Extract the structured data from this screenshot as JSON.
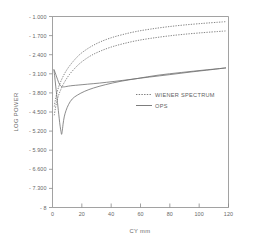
{
  "chart_data": {
    "type": "line",
    "title": "",
    "xlabel": "CY mm",
    "ylabel": "LOG POWER",
    "xlim": [
      0,
      120
    ],
    "ylim": [
      -8,
      -1.0
    ],
    "xticks": [
      0,
      20,
      40,
      60,
      80,
      100,
      120
    ],
    "xtick_labels": [
      "0",
      "20",
      "40",
      "60",
      "80",
      "100",
      "120"
    ],
    "yticks": [
      -1.0,
      -1.7,
      -2.4,
      -3.1,
      -3.8,
      -4.5,
      -5.2,
      -5.9,
      -6.6,
      -7.3,
      -8
    ],
    "ytick_labels": [
      "- 1.000",
      "- 1.700",
      "- 2.400",
      "- 3.100",
      "- 3.800",
      "- 4.500",
      "- 5.200",
      "- 5.900",
      "- 6.600",
      "- 7.300",
      "- 8"
    ],
    "grid": false,
    "legend_position": "center-right",
    "legend": [
      {
        "name": "WIENER SPECTRUM",
        "style": "dotted"
      },
      {
        "name": "OPS",
        "style": "solid"
      }
    ],
    "series": [
      {
        "name": "WIENER SPECTRUM upper",
        "style": "dotted",
        "x": [
          1.2,
          2.0,
          3.0,
          4.2,
          5.5,
          7.0,
          9.0,
          11.5,
          14.5,
          18.0,
          22.0,
          27.0,
          33.0,
          40.0,
          48.0,
          57.0,
          67.0,
          78.0,
          90.0,
          103.0,
          113.0,
          118.0
        ],
        "y": [
          -4.3,
          -4.05,
          -3.8,
          -3.58,
          -3.4,
          -3.22,
          -3.02,
          -2.82,
          -2.62,
          -2.42,
          -2.25,
          -2.08,
          -1.92,
          -1.78,
          -1.66,
          -1.55,
          -1.46,
          -1.38,
          -1.31,
          -1.25,
          -1.21,
          -1.19
        ]
      },
      {
        "name": "WIENER SPECTRUM lower",
        "style": "dotted",
        "x": [
          1.2,
          2.0,
          3.0,
          4.2,
          5.5,
          7.0,
          9.0,
          11.5,
          14.5,
          18.0,
          22.0,
          27.0,
          33.0,
          40.0,
          48.0,
          57.0,
          67.0,
          78.0,
          90.0,
          103.0,
          113.0,
          118.0
        ],
        "y": [
          -4.62,
          -4.36,
          -4.1,
          -3.88,
          -3.7,
          -3.52,
          -3.33,
          -3.13,
          -2.94,
          -2.75,
          -2.58,
          -2.41,
          -2.26,
          -2.12,
          -2.0,
          -1.89,
          -1.8,
          -1.72,
          -1.65,
          -1.59,
          -1.55,
          -1.53
        ]
      },
      {
        "name": "OPS flat",
        "style": "solid",
        "x": [
          1.0,
          1.8,
          2.6,
          3.4,
          4.2,
          5.2,
          6.3,
          7.5,
          9.0,
          11.0,
          14.0,
          18.0,
          24.0,
          32.0,
          42.0,
          54.0,
          66.0,
          80.0,
          95.0,
          108.0,
          118.0
        ],
        "y": [
          -2.95,
          -3.05,
          -3.18,
          -3.3,
          -3.42,
          -3.52,
          -3.57,
          -3.58,
          -3.57,
          -3.55,
          -3.53,
          -3.51,
          -3.48,
          -3.44,
          -3.38,
          -3.3,
          -3.22,
          -3.13,
          -3.03,
          -2.95,
          -2.88
        ]
      },
      {
        "name": "OPS dip",
        "style": "solid",
        "x": [
          1.0,
          1.6,
          2.2,
          2.8,
          3.4,
          4.0,
          4.6,
          5.2,
          5.8,
          6.2,
          6.6,
          7.2,
          8.0,
          9.2,
          11.0,
          13.5,
          17.0,
          22.0,
          28.0,
          36.0,
          46.0,
          58.0,
          72.0,
          88.0,
          104.0,
          118.0
        ],
        "y": [
          -2.96,
          -3.25,
          -3.55,
          -3.85,
          -4.15,
          -4.45,
          -4.75,
          -5.02,
          -5.22,
          -5.32,
          -5.22,
          -4.95,
          -4.68,
          -4.45,
          -4.22,
          -4.02,
          -3.88,
          -3.74,
          -3.62,
          -3.5,
          -3.38,
          -3.27,
          -3.15,
          -3.05,
          -2.96,
          -2.89
        ]
      }
    ]
  }
}
